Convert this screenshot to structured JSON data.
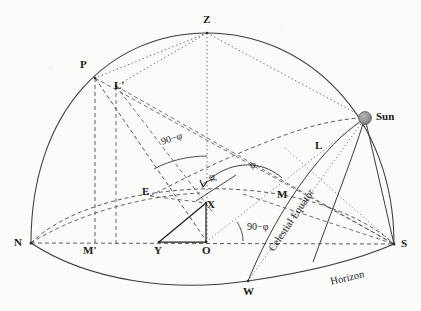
{
  "figure": {
    "type": "astronomy-diagram",
    "background_color": "#fbfbfa",
    "ink_color": "#2b2b2b",
    "sun_color": "#8e8e8e"
  },
  "points": {
    "zenith": "Z",
    "pole": "P",
    "pole_projection": "L'",
    "north": "N",
    "south": "S",
    "east": "E",
    "west": "W",
    "origin": "O",
    "foot_y": "Y",
    "point_x": "X",
    "point_m": "M",
    "point_m_prime": "M'",
    "point_l": "L",
    "sun": "Sun"
  },
  "curve_labels": {
    "celestial_equator": "Celestial Equator",
    "horizon": "Horizon"
  },
  "angles": {
    "polar_altitude": "90−φ",
    "equator_altitude": "90−φ",
    "latitude_big": "φ",
    "latitude_small": "φ"
  }
}
